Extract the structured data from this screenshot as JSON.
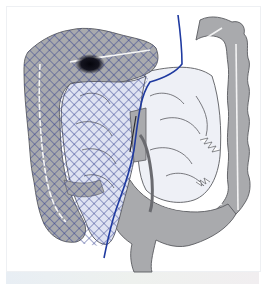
{
  "diagram": {
    "colors": {
      "background": "#ffffff",
      "bowel_fill": "#a9aaad",
      "bowel_outline": "#5a5b60",
      "hatch": "#2c3a8c",
      "hatch_area_light": "#dfe3f2",
      "resection_line": "#1f3aa0",
      "small_bowel_fill": "#eef0f6",
      "lesion": "#0b0b14"
    },
    "regions": [
      {
        "name": "ascending-colon",
        "hatched": true
      },
      {
        "name": "transverse-colon",
        "hatched": true,
        "partial": true
      },
      {
        "name": "small-bowel-mesentery",
        "hatched": true
      },
      {
        "name": "descending-colon",
        "hatched": false
      },
      {
        "name": "sigmoid-colon",
        "hatched": false
      },
      {
        "name": "rectum",
        "hatched": false
      }
    ],
    "markers": [
      {
        "name": "lesion",
        "location": "hepatic flexure / transverse colon"
      }
    ]
  }
}
